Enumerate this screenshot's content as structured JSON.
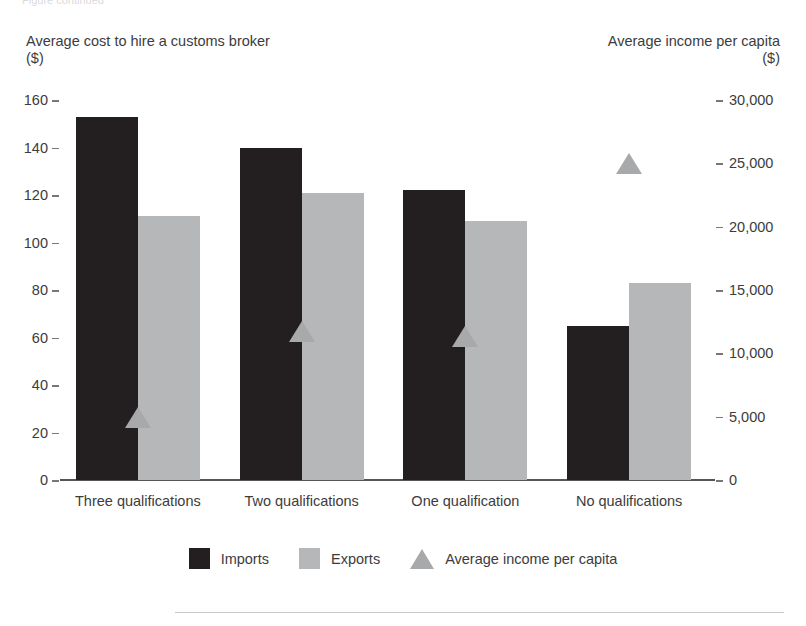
{
  "artifact": {
    "top_clipped_text": "Figure continued"
  },
  "captions": {
    "left": "Average cost to hire a customs broker\n($)",
    "right": "Average income per capita\n($)"
  },
  "legend": {
    "items": [
      {
        "label": "Imports",
        "marker": "square-swatch-dark",
        "color": "#231f20"
      },
      {
        "label": "Exports",
        "marker": "square-swatch-grey",
        "color": "#b6b7b9"
      },
      {
        "label": "Average income per capita",
        "marker": "triangle-marker",
        "color": "#a7a9ab"
      }
    ]
  },
  "chart_data": {
    "type": "bar",
    "title": "",
    "subtitle": "",
    "xlabel": "",
    "ylabel": "Average cost to hire a customs broker ($)",
    "y2label": "Average income per capita ($)",
    "grid": false,
    "legend_position": "bottom",
    "categories": [
      "Three qualifications",
      "Two  qualifications",
      "One  qualification",
      "No qualifications"
    ],
    "ylim": [
      0,
      160
    ],
    "yticks": [
      0,
      20,
      40,
      60,
      80,
      100,
      120,
      140,
      160
    ],
    "ytick_labels": [
      "0",
      "20",
      "40",
      "60",
      "80",
      "100",
      "120",
      "140",
      "160"
    ],
    "y2lim": [
      0,
      30000
    ],
    "y2ticks": [
      0,
      5000,
      10000,
      15000,
      20000,
      25000,
      30000
    ],
    "y2tick_labels": [
      "0",
      "5,000",
      "10,000",
      "15,000",
      "20,000",
      "25,000",
      "30,000"
    ],
    "series": [
      {
        "name": "Imports",
        "type": "bar",
        "axis": "left",
        "color": "#231f20",
        "values": [
          153,
          140,
          122,
          65
        ]
      },
      {
        "name": "Exports",
        "type": "bar",
        "axis": "left",
        "color": "#b6b7b9",
        "values": [
          111,
          121,
          109,
          83
        ]
      },
      {
        "name": "Average income per capita",
        "type": "marker",
        "axis": "right",
        "color": "#a7a9ab",
        "values": [
          5000,
          11800,
          11400,
          25000
        ]
      }
    ]
  }
}
